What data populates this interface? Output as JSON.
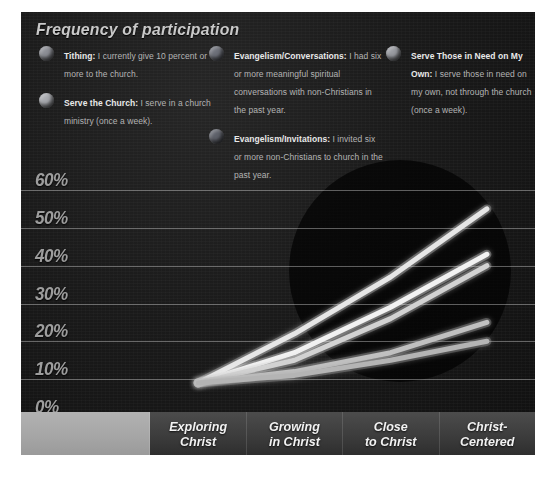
{
  "title": "Frequency of participation",
  "legend": {
    "columns": [
      {
        "items": [
          {
            "dot_color": "#8d8f96",
            "name": "Tithing:",
            "description": " I currently give 10 percent or more to the church."
          },
          {
            "dot_color": "#a9abb0",
            "name": "Serve the Church:",
            "description": " I serve in a church ministry (once a week)."
          }
        ]
      },
      {
        "items": [
          {
            "dot_color": "#6e717a",
            "name": "Evangelism/Conversations:",
            "description": " I had six or more meaningful spiritual conversations with non-Christians in the past year."
          },
          {
            "dot_color": "#5f626b",
            "name": "Evangelism/Invitations:",
            "description": " I invited six or more non-Christians to church in the past year."
          }
        ]
      },
      {
        "items": [
          {
            "dot_color": "#9a9ca2",
            "name": "Serve Those in Need on My Own:",
            "description": " I serve those in need on my own, not through the church (once a week)."
          }
        ]
      }
    ]
  },
  "chart_data": {
    "type": "line",
    "title": "Frequency of participation",
    "xlabel": "",
    "ylabel": "",
    "ylim": [
      0,
      60
    ],
    "ytick_labels": [
      "60%",
      "50%",
      "40%",
      "30%",
      "20%",
      "10%",
      "0%"
    ],
    "yticks": [
      60,
      50,
      40,
      30,
      20,
      10,
      0
    ],
    "grid": true,
    "legend_position": "top",
    "categories": [
      "Exploring Christ",
      "Growing in Christ",
      "Close to Christ",
      "Christ-Centered"
    ],
    "series": [
      {
        "name": "Evangelism/Conversations",
        "color": "#e6e6e6",
        "values": [
          9,
          22,
          37,
          55
        ]
      },
      {
        "name": "Serve the Church",
        "color": "#f2f2f2",
        "values": [
          9,
          17,
          29,
          43
        ]
      },
      {
        "name": "Tithing",
        "color": "#d2d2d2",
        "values": [
          9,
          15,
          26,
          40
        ]
      },
      {
        "name": "Serve Those in Need on My Own",
        "color": "#c0c0c0",
        "values": [
          9,
          12,
          17,
          25
        ]
      },
      {
        "name": "Evangelism/Invitations",
        "color": "#b4b4b4",
        "values": [
          9,
          11,
          15,
          20
        ]
      }
    ]
  },
  "xaxis": {
    "pad_label": "",
    "categories": [
      "Exploring\nChrist",
      "Growing\nin Christ",
      "Close\nto Christ",
      "Christ-\nCentered"
    ]
  }
}
